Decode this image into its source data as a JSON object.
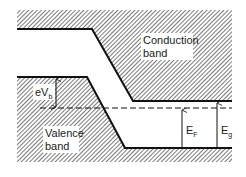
{
  "diagram": {
    "type": "semiconductor band diagram",
    "labels": {
      "conduction_line1": "Conduction",
      "conduction_line2": "band",
      "valence_line1": "Valence",
      "valence_line2": "band",
      "barrier": "eV",
      "barrier_sub": "b",
      "fermi": "E",
      "fermi_sub": "F",
      "gap": "E",
      "gap_sub": "g"
    },
    "colors": {
      "line": "#111111",
      "hatch": "#333333",
      "background": "#ffffff"
    }
  }
}
